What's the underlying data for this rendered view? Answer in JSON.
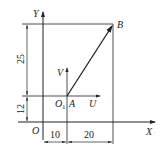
{
  "diagram": {
    "axes": {
      "x_label": "X",
      "y_label": "Y",
      "origin_label": "O"
    },
    "local_axes": {
      "u_label": "U",
      "v_label": "V",
      "origin_label": "O",
      "origin_subscript": "1"
    },
    "points": {
      "a_label": "A",
      "b_label": "B"
    },
    "dimensions": {
      "vertical_lower": "12",
      "vertical_upper": "25",
      "horizontal_left": "10",
      "horizontal_right": "20"
    }
  }
}
